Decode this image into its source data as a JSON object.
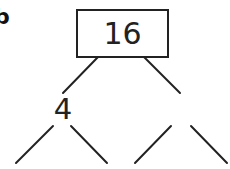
{
  "diagram": {
    "type": "factor-tree",
    "part_label": "b",
    "root": {
      "value": "16"
    },
    "children": [
      {
        "value": "4",
        "children": [
          {
            "value": ""
          },
          {
            "value": ""
          }
        ]
      },
      {
        "value": "",
        "children": [
          {
            "value": ""
          },
          {
            "value": ""
          }
        ]
      }
    ]
  }
}
